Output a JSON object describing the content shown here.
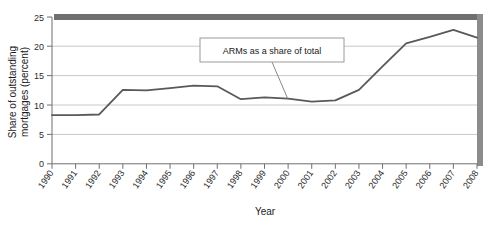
{
  "chart_data": {
    "type": "line",
    "title": "",
    "xlabel": "Year",
    "ylabel": "Share of outstanding mortgages (percent)",
    "ylabel_line1": "Share of outstanding",
    "ylabel_line2": "mortgages (percent)",
    "categories": [
      "1990",
      "1991",
      "1992",
      "1993",
      "1994",
      "1995",
      "1996",
      "1997",
      "1998",
      "1999",
      "2000",
      "2001",
      "2002",
      "2003",
      "2004",
      "2005",
      "2006",
      "2007",
      "2008"
    ],
    "series": [
      {
        "name": "ARMs as a share of total",
        "values": [
          8.3,
          8.3,
          8.4,
          12.6,
          12.5,
          12.9,
          13.3,
          13.2,
          11.0,
          11.3,
          11.1,
          10.6,
          10.8,
          12.6,
          16.6,
          20.5,
          21.6,
          22.8,
          21.5
        ]
      }
    ],
    "ylim": [
      0,
      25
    ],
    "yticks": [
      0,
      5,
      10,
      15,
      20,
      25
    ],
    "ytick_labels": [
      "0",
      "5",
      "10",
      "15",
      "20",
      "25"
    ],
    "xtick_labels": [
      "1990",
      "1991",
      "1992",
      "1993",
      "1994",
      "1995",
      "1996",
      "1997",
      "1998",
      "1999",
      "2000",
      "2001",
      "2002",
      "2003",
      "2004",
      "2005",
      "2006",
      "2007",
      "2008"
    ],
    "grid": "horizontal",
    "legend": "none",
    "annotations": [
      {
        "text": "ARMs as a share of total",
        "target_year": "2000",
        "target_value": 11.1
      }
    ],
    "colors": {
      "line": "#595959",
      "grid": "#c9c9c9",
      "axis": "#8a8a8a",
      "plot_border_shadow": "#777777",
      "annotation_border": "#9a9a9a",
      "background": "#ffffff"
    }
  }
}
